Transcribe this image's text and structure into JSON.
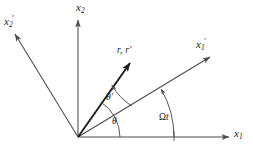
{
  "figure": {
    "background_color": "#ffffff",
    "line_color": "#4a4a4a",
    "vector_color": "#1a1a1a",
    "width": 253,
    "height": 153
  },
  "labels": {
    "x2": "x",
    "x2_sub": "2",
    "x1": "x",
    "x1_sub": "1",
    "x1_prime": "x",
    "x1_prime_sub": "1",
    "x1_prime_mark": "′",
    "x2_prime": "x",
    "x2_prime_sub": "2",
    "x2_prime_mark": "′",
    "r_vector": "r, r′",
    "theta": "θ",
    "theta_prime": "θ′",
    "omega_t_symbol": "Ω",
    "omega_t_var": "t"
  },
  "geometry": {
    "origin": {
      "x": 78,
      "y": 137
    },
    "axes": [
      {
        "name": "x1-axis",
        "angle_deg": 0,
        "tip": {
          "x": 231,
          "y": 137
        }
      },
      {
        "name": "x2-axis",
        "angle_deg": 90,
        "tip": {
          "x": 78,
          "y": 18
        }
      },
      {
        "name": "x1-prime-axis",
        "angle_deg": 30,
        "tip": {
          "x": 213,
          "y": 55
        }
      },
      {
        "name": "x2-prime-axis",
        "angle_deg": 120,
        "tip": {
          "x": 12,
          "y": 32
        }
      },
      {
        "name": "r-vector",
        "angle_deg": 57,
        "tip": {
          "x": 133,
          "y": 60
        }
      }
    ],
    "arcs": [
      {
        "name": "theta-arc",
        "from_deg": 0,
        "to_deg": 57,
        "radius": 42
      },
      {
        "name": "theta-prime-arc",
        "from_deg": 30,
        "to_deg": 57,
        "radius": 62
      },
      {
        "name": "omega-t-arc",
        "from_deg": 0,
        "to_deg": 30,
        "radius": 96
      }
    ]
  }
}
